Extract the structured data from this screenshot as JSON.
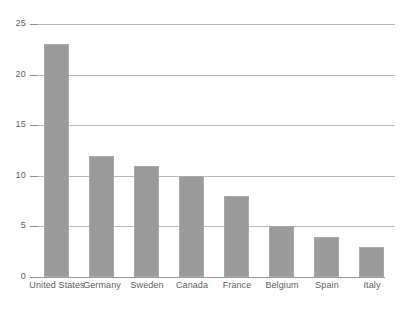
{
  "chart_data": {
    "type": "bar",
    "title": "",
    "subtitle": "",
    "xlabel": "",
    "ylabel": "",
    "categories": [
      "United States",
      "Germany",
      "Sweden",
      "Canada",
      "France",
      "Belgium",
      "Spain",
      "Italy"
    ],
    "values": [
      23,
      12,
      11,
      10,
      8,
      5,
      4,
      3
    ],
    "ylim": [
      0,
      25
    ],
    "ytick_labels": [
      "0",
      "5",
      "10",
      "15",
      "20",
      "25"
    ],
    "ytick_values": [
      0,
      5,
      10,
      15,
      20,
      25
    ],
    "grid": true,
    "legend": false,
    "legend_position": "none",
    "bar_color": "#9b9b9b",
    "gridline_color": "#b9b9b9",
    "axis_color": "#9a9a9a",
    "text_color": "#5e5e5e",
    "background_color": "#ffffff"
  }
}
